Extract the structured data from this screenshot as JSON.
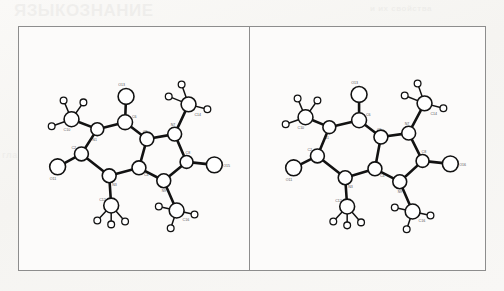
{
  "page": {
    "background_color": "#f7f6f4",
    "bleed_through": {
      "title": "ЯЗЫКОЗНАНИЕ",
      "top_right": "и их свойства",
      "left_side": "глава вторая",
      "middle_right": "структура"
    }
  },
  "figure": {
    "frame_color": "#8d8d8d",
    "panel_background": "#fcfbfa",
    "panels": [
      {
        "id": "panel-left",
        "name": "molecule-view-a"
      },
      {
        "id": "panel-right",
        "name": "molecule-view-b"
      }
    ]
  },
  "molecule": {
    "type": "ortep-thermal-ellipsoid-plot",
    "bond_color": "#121212",
    "atom_fill": "#ffffff",
    "atoms": [
      {
        "label": "C2",
        "element": "C",
        "x": 62,
        "y": 128
      },
      {
        "label": "N1",
        "element": "N",
        "x": 78,
        "y": 103
      },
      {
        "label": "C6",
        "element": "C",
        "x": 106,
        "y": 96
      },
      {
        "label": "O13",
        "element": "O",
        "x": 107,
        "y": 70
      },
      {
        "label": "C5",
        "element": "C",
        "x": 128,
        "y": 113
      },
      {
        "label": "C4",
        "element": "C",
        "x": 120,
        "y": 142
      },
      {
        "label": "N3",
        "element": "N",
        "x": 90,
        "y": 150
      },
      {
        "label": "O11",
        "element": "O",
        "x": 38,
        "y": 141
      },
      {
        "label": "C10",
        "element": "C",
        "x": 52,
        "y": 93
      },
      {
        "label": "C12",
        "element": "C",
        "x": 92,
        "y": 180
      },
      {
        "label": "N7",
        "element": "N",
        "x": 156,
        "y": 108
      },
      {
        "label": "C8",
        "element": "C",
        "x": 168,
        "y": 136
      },
      {
        "label": "N9",
        "element": "N",
        "x": 145,
        "y": 155
      },
      {
        "label": "O15",
        "element": "O",
        "x": 196,
        "y": 139
      },
      {
        "label": "C14",
        "element": "C",
        "x": 170,
        "y": 78
      },
      {
        "label": "C16",
        "element": "C",
        "x": 158,
        "y": 185
      }
    ],
    "right_panel_terminal_oxygen_label": "O16"
  }
}
